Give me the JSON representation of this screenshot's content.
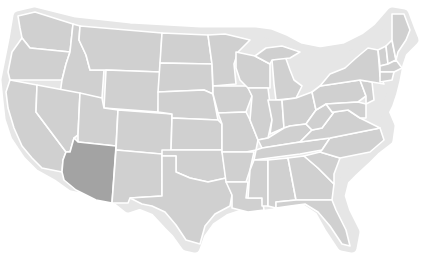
{
  "map": {
    "type": "us-states-outline",
    "colors": {
      "background": "#ffffff",
      "state_fill": "#d0d0d0",
      "highlight_fill": "#a3a3a3",
      "border": "#ffffff",
      "outer_halo": "#e6e6e6"
    },
    "highlighted_states": [
      "Arizona"
    ],
    "states": [
      {
        "id": "WA",
        "name": "Washington",
        "highlighted": false
      },
      {
        "id": "OR",
        "name": "Oregon",
        "highlighted": false
      },
      {
        "id": "CA",
        "name": "California",
        "highlighted": false
      },
      {
        "id": "ID",
        "name": "Idaho",
        "highlighted": false
      },
      {
        "id": "NV",
        "name": "Nevada",
        "highlighted": false
      },
      {
        "id": "MT",
        "name": "Montana",
        "highlighted": false
      },
      {
        "id": "WY",
        "name": "Wyoming",
        "highlighted": false
      },
      {
        "id": "UT",
        "name": "Utah",
        "highlighted": false
      },
      {
        "id": "AZ",
        "name": "Arizona",
        "highlighted": true
      },
      {
        "id": "CO",
        "name": "Colorado",
        "highlighted": false
      },
      {
        "id": "NM",
        "name": "New Mexico",
        "highlighted": false
      },
      {
        "id": "ND",
        "name": "North Dakota",
        "highlighted": false
      },
      {
        "id": "SD",
        "name": "South Dakota",
        "highlighted": false
      },
      {
        "id": "NE",
        "name": "Nebraska",
        "highlighted": false
      },
      {
        "id": "KS",
        "name": "Kansas",
        "highlighted": false
      },
      {
        "id": "OK",
        "name": "Oklahoma",
        "highlighted": false
      },
      {
        "id": "TX",
        "name": "Texas",
        "highlighted": false
      },
      {
        "id": "MN",
        "name": "Minnesota",
        "highlighted": false
      },
      {
        "id": "IA",
        "name": "Iowa",
        "highlighted": false
      },
      {
        "id": "MO",
        "name": "Missouri",
        "highlighted": false
      },
      {
        "id": "AR",
        "name": "Arkansas",
        "highlighted": false
      },
      {
        "id": "LA",
        "name": "Louisiana",
        "highlighted": false
      },
      {
        "id": "WI",
        "name": "Wisconsin",
        "highlighted": false
      },
      {
        "id": "IL",
        "name": "Illinois",
        "highlighted": false
      },
      {
        "id": "MI",
        "name": "Michigan",
        "highlighted": false
      },
      {
        "id": "IN",
        "name": "Indiana",
        "highlighted": false
      },
      {
        "id": "OH",
        "name": "Ohio",
        "highlighted": false
      },
      {
        "id": "KY",
        "name": "Kentucky",
        "highlighted": false
      },
      {
        "id": "TN",
        "name": "Tennessee",
        "highlighted": false
      },
      {
        "id": "MS",
        "name": "Mississippi",
        "highlighted": false
      },
      {
        "id": "AL",
        "name": "Alabama",
        "highlighted": false
      },
      {
        "id": "GA",
        "name": "Georgia",
        "highlighted": false
      },
      {
        "id": "FL",
        "name": "Florida",
        "highlighted": false
      },
      {
        "id": "SC",
        "name": "South Carolina",
        "highlighted": false
      },
      {
        "id": "NC",
        "name": "North Carolina",
        "highlighted": false
      },
      {
        "id": "VA",
        "name": "Virginia",
        "highlighted": false
      },
      {
        "id": "WV",
        "name": "West Virginia",
        "highlighted": false
      },
      {
        "id": "PA",
        "name": "Pennsylvania",
        "highlighted": false
      },
      {
        "id": "NY",
        "name": "New York",
        "highlighted": false
      },
      {
        "id": "VT",
        "name": "Vermont",
        "highlighted": false
      },
      {
        "id": "NH",
        "name": "New Hampshire",
        "highlighted": false
      },
      {
        "id": "ME",
        "name": "Maine",
        "highlighted": false
      },
      {
        "id": "MA",
        "name": "Massachusetts",
        "highlighted": false
      },
      {
        "id": "CT",
        "name": "Connecticut",
        "highlighted": false
      },
      {
        "id": "RI",
        "name": "Rhode Island",
        "highlighted": false
      },
      {
        "id": "NJ",
        "name": "New Jersey",
        "highlighted": false
      },
      {
        "id": "DE",
        "name": "Delaware",
        "highlighted": false
      },
      {
        "id": "MD",
        "name": "Maryland",
        "highlighted": false
      }
    ]
  }
}
